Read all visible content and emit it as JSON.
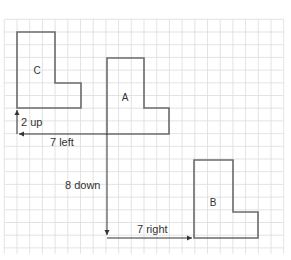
{
  "diagram": {
    "type": "translation-on-grid",
    "grid": {
      "color": "#dcdcdc",
      "cell_px": 12.7,
      "origin_x": 4.3,
      "origin_y": 19.3,
      "cols": 22,
      "rows": 18
    },
    "shapes": [
      {
        "id": "C",
        "label": "C",
        "color": "#6b6b6b"
      },
      {
        "id": "A",
        "label": "A",
        "color": "#6b6b6b"
      },
      {
        "id": "B",
        "label": "B",
        "color": "#6b6b6b"
      }
    ],
    "arrows": [
      {
        "id": "up",
        "label": "2 up"
      },
      {
        "id": "left",
        "label": "7 left"
      },
      {
        "id": "down",
        "label": "8 down"
      },
      {
        "id": "right",
        "label": "7 right"
      }
    ],
    "arrow_color": "#333333"
  }
}
